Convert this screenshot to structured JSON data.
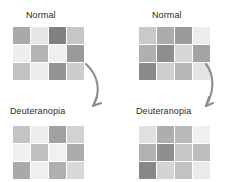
{
  "figure": {
    "background": "#ffffff",
    "label_color": "#2b2b2b",
    "arrow_color": "#8d8d8d"
  },
  "panels": {
    "top_left": {
      "label": "Normal",
      "label_x": 26,
      "label_y": 10,
      "grid_x": 13,
      "grid_y": 27
    },
    "top_right": {
      "label": "Normal",
      "label_x": 152,
      "label_y": 10,
      "grid_x": 139,
      "grid_y": 27
    },
    "bottom_left": {
      "label": "Deuteranopia",
      "label_x": 10,
      "label_y": 106,
      "grid_x": 13,
      "grid_y": 126
    },
    "bottom_right": {
      "label": "Deuteranopia",
      "label_x": 136,
      "label_y": 106,
      "grid_x": 139,
      "grid_y": 126
    }
  },
  "chart_data": {
    "type": "heatmap",
    "title": "",
    "grid_shape": [
      3,
      4
    ],
    "colormap": "grayscale",
    "grids": {
      "top_left": [
        [
          "#a8a8a8",
          "#e6e6e6",
          "#818181",
          "#c6c6c6"
        ],
        [
          "#eeeeee",
          "#b4b4b4",
          "#efefef",
          "#9a9a9a"
        ],
        [
          "#c2c2c2",
          "#ededed",
          "#939393",
          "#cdcdcd"
        ]
      ],
      "top_right": [
        [
          "#c9c9c9",
          "#ababab",
          "#9a9a9a",
          "#ececec"
        ],
        [
          "#b0b0b0",
          "#8e8e8e",
          "#d6d6d6",
          "#a4a4a4"
        ],
        [
          "#8a8a8a",
          "#cfcfcf",
          "#b6b6b6",
          "#e4e4e4"
        ]
      ],
      "bottom_left": [
        [
          "#c4c4c4",
          "#ececec",
          "#a0a0a0",
          "#d2d2d2"
        ],
        [
          "#f0f0f0",
          "#c0c0c0",
          "#f1f1f1",
          "#ababab"
        ],
        [
          "#a9a9a9",
          "#efefef",
          "#b0b0b0",
          "#d8d8d8"
        ]
      ],
      "bottom_right": [
        [
          "#e0e0e0",
          "#aeaeae",
          "#b9b9b9",
          "#f0f0f0"
        ],
        [
          "#b2b2b2",
          "#8f8f8f",
          "#c7c7c7",
          "#bdbdbd"
        ],
        [
          "#878787",
          "#d4d4d4",
          "#c2c2c2",
          "#eaeaea"
        ]
      ]
    }
  },
  "arrows": {
    "left": {
      "name": "normal-to-deuteranopia-arrow-left",
      "path": "M 86 64 C 99 76, 101 92, 93 106",
      "head": "M 93 106 L 97 97 M 93 106 L 101 103"
    },
    "right": {
      "name": "normal-to-deuteranopia-arrow-right",
      "path": "M 206 64 C 215 76, 214 92, 206 106",
      "head": "M 206 106 L 209 97 M 206 106 L 213 103"
    }
  }
}
